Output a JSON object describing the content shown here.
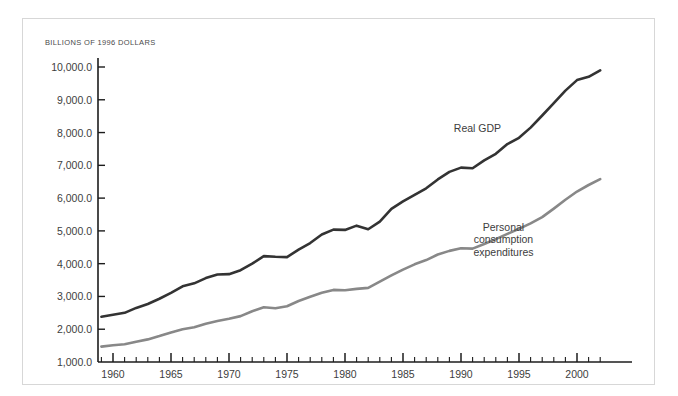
{
  "figure": {
    "unit_label": "BILLIONS OF 1996 DOLLARS",
    "border_color": "#d7d7d7",
    "background": "#ffffff"
  },
  "axes": {
    "y_ticks": [
      "10,000.0",
      "9,000.0",
      "8,000.0",
      "7,000.0",
      "6,000.0",
      "5,000.0",
      "4,000.0",
      "3,000.0",
      "2,000.0",
      "1,000.0"
    ],
    "x_ticks": [
      "1960",
      "1965",
      "1970",
      "1975",
      "1980",
      "1985",
      "1990",
      "1995",
      "2000"
    ],
    "axis_color": "#1c1c1c"
  },
  "series_labels": {
    "gdp": "Real GDP",
    "pce_line1": "Personal",
    "pce_line2": "consumption",
    "pce_line3": "expenditures"
  },
  "chart_data": {
    "type": "line",
    "title": "",
    "subtitle": "",
    "xlabel": "",
    "ylabel": "BILLIONS OF 1996 DOLLARS",
    "xlim": [
      1959,
      2002
    ],
    "ylim": [
      1000,
      10000
    ],
    "grid": false,
    "legend": "inline-annotations",
    "x_tick_interval_major": 5,
    "x_tick_interval_minor": 1,
    "y_tick_interval": 1000,
    "x": [
      1959,
      1960,
      1961,
      1962,
      1963,
      1964,
      1965,
      1966,
      1967,
      1968,
      1969,
      1970,
      1971,
      1972,
      1973,
      1974,
      1975,
      1976,
      1977,
      1978,
      1979,
      1980,
      1981,
      1982,
      1983,
      1984,
      1985,
      1986,
      1987,
      1988,
      1989,
      1990,
      1991,
      1992,
      1993,
      1994,
      1995,
      1996,
      1997,
      1998,
      1999,
      2000,
      2001,
      2002
    ],
    "series": [
      {
        "name": "Real GDP",
        "color": "#333333",
        "width": 2.6,
        "values": [
          2380,
          2440,
          2500,
          2650,
          2770,
          2930,
          3110,
          3310,
          3400,
          3560,
          3670,
          3680,
          3800,
          4000,
          4230,
          4210,
          4200,
          4430,
          4630,
          4890,
          5040,
          5030,
          5160,
          5050,
          5280,
          5670,
          5900,
          6100,
          6300,
          6570,
          6800,
          6930,
          6910,
          7150,
          7350,
          7650,
          7840,
          8150,
          8520,
          8900,
          9280,
          9600,
          9700,
          9900
        ]
      },
      {
        "name": "Personal consumption expenditures",
        "color": "#888888",
        "width": 2.6,
        "values": [
          1470,
          1510,
          1540,
          1620,
          1690,
          1790,
          1900,
          2000,
          2060,
          2170,
          2250,
          2320,
          2400,
          2550,
          2670,
          2640,
          2700,
          2860,
          2990,
          3110,
          3200,
          3190,
          3230,
          3260,
          3450,
          3640,
          3820,
          3980,
          4110,
          4280,
          4390,
          4470,
          4460,
          4600,
          4750,
          4910,
          5060,
          5230,
          5420,
          5680,
          5950,
          6200,
          6400,
          6580
        ]
      }
    ],
    "annotations": [
      {
        "text": "Real GDP",
        "x": 1993,
        "y": 8100
      },
      {
        "text": "Personal consumption expenditures",
        "x": 1994,
        "y": 4700
      }
    ]
  }
}
